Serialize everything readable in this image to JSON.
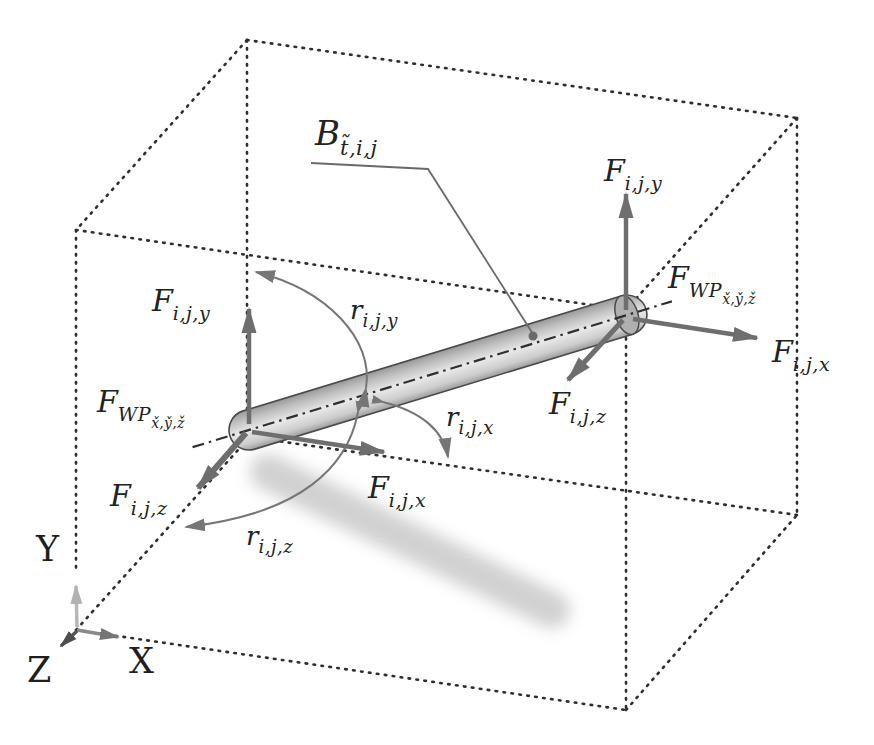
{
  "palette": {
    "background": "#ffffff",
    "dotted_line": "#2e2e2e",
    "force_arrow": "#6e6e6e",
    "arc_arrow": "#767676",
    "beam_outline": "#4a4a4a",
    "beam_fill_light": "#e9e9e9",
    "beam_fill_dark": "#989898",
    "axis_x": "#8a8a8a",
    "axis_y": "#b7b7b7",
    "axis_z": "#555555",
    "label_color": "#222222"
  },
  "labels": {
    "beam": {
      "main": "B",
      "sub": "t̃,i,j"
    },
    "force_left_y": {
      "main": "F",
      "sub": "i,j,y"
    },
    "force_left_x": {
      "main": "F",
      "sub": "i,j,x"
    },
    "force_left_z": {
      "main": "F",
      "sub": "i,j,z"
    },
    "wp_left": {
      "main": "F",
      "sub": "WP",
      "subsub": "x̌,y̌,ž"
    },
    "force_right_y": {
      "main": "F",
      "sub": "i,j,y"
    },
    "force_right_x": {
      "main": "F",
      "sub": "i,j,x"
    },
    "force_right_z": {
      "main": "F",
      "sub": "i,j,z"
    },
    "wp_right": {
      "main": "F",
      "sub": "WP",
      "subsub": "x̌,y̌,ž"
    },
    "rot_y": {
      "main": "r",
      "sub": "i,j,y"
    },
    "rot_x": {
      "main": "r",
      "sub": "i,j,x"
    },
    "rot_z": {
      "main": "r",
      "sub": "i,j,z"
    },
    "axis_x": "X",
    "axis_y": "Y",
    "axis_z": "Z"
  }
}
